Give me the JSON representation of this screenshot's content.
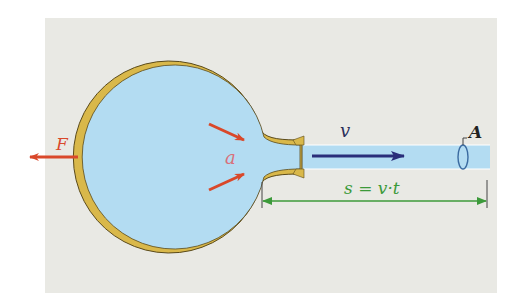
{
  "diagram": {
    "type": "physics-illustration",
    "labels": {
      "force": "F",
      "acceleration": "a",
      "velocity": "v",
      "area": "A",
      "distance_formula": "s = v·t"
    },
    "colors": {
      "panel_background": "#e9e9e4",
      "fluid": "#b3dcf2",
      "wall": "#d9b84a",
      "wall_outline": "#5a4a1a",
      "force_arrow": "#d9482a",
      "velocity_arrow": "#2a2e7a",
      "measure_line": "#3c9a3a",
      "label_red": "#d9482a",
      "label_dark": "#2a2e5a",
      "label_green": "#3c9a3a"
    }
  }
}
